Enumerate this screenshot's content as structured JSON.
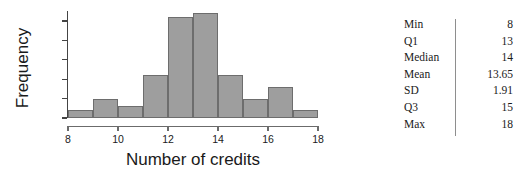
{
  "chart_data": {
    "type": "bar",
    "title": "",
    "xlabel": "Number of credits",
    "ylabel": "Frequency",
    "categories": [
      "8-9",
      "9-10",
      "10-11",
      "11-12",
      "12-13",
      "13-14",
      "14-15",
      "15-16",
      "16-17",
      "17-18"
    ],
    "bin_edges": [
      8,
      9,
      10,
      11,
      12,
      13,
      14,
      15,
      16,
      17,
      18
    ],
    "values": [
      2,
      5,
      3,
      11,
      26,
      27,
      11,
      5,
      8,
      2
    ],
    "xlim": [
      8,
      18
    ],
    "ylim": [
      0,
      27
    ],
    "xticks": [
      8,
      10,
      12,
      14,
      16,
      18
    ],
    "yticks": [
      0,
      5,
      10,
      15,
      20,
      25
    ],
    "grid": false,
    "legend": false,
    "bar_color": "#9e9e9e",
    "bar_border_color": "#6d6d6d",
    "axis_color": "#444444"
  },
  "stats": {
    "rows": [
      {
        "label": "Min",
        "value": "8"
      },
      {
        "label": "Q1",
        "value": "13"
      },
      {
        "label": "Median",
        "value": "14"
      },
      {
        "label": "Mean",
        "value": "13.65"
      },
      {
        "label": "SD",
        "value": "1.91"
      },
      {
        "label": "Q3",
        "value": "15"
      },
      {
        "label": "Max",
        "value": "18"
      }
    ]
  }
}
